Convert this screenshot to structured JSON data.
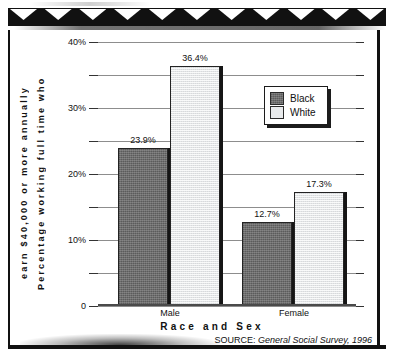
{
  "figure": {
    "top_band_icon": "zigzag-triangle-band",
    "triangle_count": 11
  },
  "chart_data": {
    "type": "bar",
    "title": "",
    "subtitle": "",
    "xlabel": "Race and Sex",
    "ylabel": "Percentage working full time who earn $40,000 or more annually",
    "ylabel_line1": "Percentage working full time who",
    "ylabel_line2": "earn $40,000 or more annually",
    "categories": [
      "Male",
      "Female"
    ],
    "series": [
      {
        "name": "Black",
        "values": [
          23.9,
          12.7
        ],
        "labels": [
          "23.9%",
          "12.7%"
        ],
        "color": "#6d6d6d"
      },
      {
        "name": "White",
        "values": [
          36.4,
          17.3
        ],
        "labels": [
          "36.4%",
          "17.3%"
        ],
        "color": "#e3e5e7"
      }
    ],
    "ylim": [
      0,
      40
    ],
    "ytick_values": [
      0,
      10,
      20,
      30,
      40
    ],
    "ytick_labels": [
      "0",
      "10%",
      "20%",
      "30%",
      "40%"
    ],
    "yminor_values": [
      5,
      15,
      25,
      35
    ],
    "grid": true,
    "grid_interval": 5,
    "legend_position": "upper right",
    "source": "SOURCE: General Social Survey, 1996",
    "source_prefix": "SOURCE: ",
    "source_name": "General Social Survey, 1996"
  },
  "legend": {
    "items": [
      {
        "label": "Black",
        "swatch": "black"
      },
      {
        "label": "White",
        "swatch": "white"
      }
    ]
  }
}
